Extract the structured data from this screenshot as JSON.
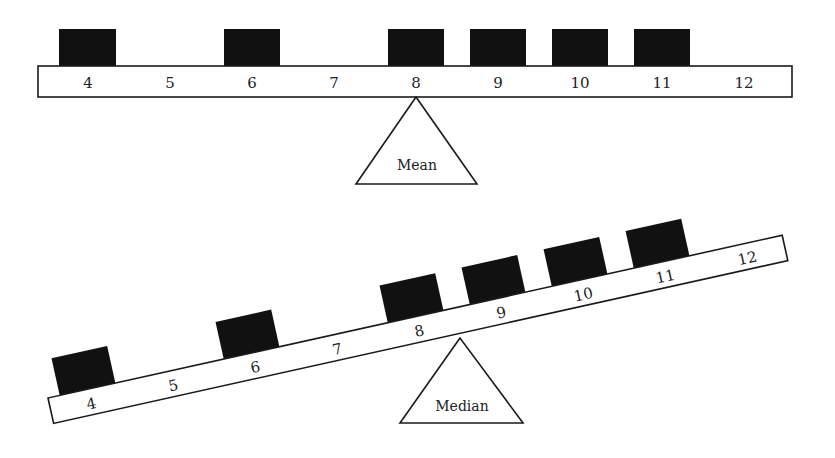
{
  "diagram": {
    "type": "balance-beam-comparison",
    "data_values": [
      4,
      6,
      8,
      9,
      10,
      11
    ],
    "scale_labels": [
      "4",
      "5",
      "6",
      "7",
      "8",
      "9",
      "10",
      "11",
      "12"
    ],
    "top_panel": {
      "pivot_label": "Mean",
      "pivot_at": 8,
      "state": "balanced"
    },
    "bottom_panel": {
      "pivot_label": "Median",
      "pivot_at": 8.5,
      "state": "tilted"
    },
    "colors": {
      "block": "#111111",
      "beam_fill": "#ffffff",
      "stroke": "#1a1a1a"
    }
  }
}
